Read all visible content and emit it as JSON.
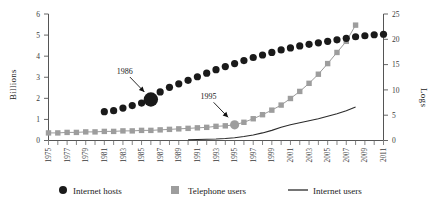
{
  "chart_data": {
    "type": "line",
    "title": "",
    "subtitle": "",
    "xlabel": "",
    "ylabel": "Billions",
    "ylabel_right": "Logs",
    "ylim": [
      0,
      6
    ],
    "ylim_right": [
      0,
      25
    ],
    "grid": false,
    "legend_position": "bottom",
    "x": [
      1975,
      1976,
      1977,
      1978,
      1979,
      1980,
      1981,
      1982,
      1983,
      1984,
      1985,
      1986,
      1987,
      1988,
      1989,
      1990,
      1991,
      1992,
      1993,
      1994,
      1995,
      1996,
      1997,
      1998,
      1999,
      2000,
      2001,
      2002,
      2003,
      2004,
      2005,
      2006,
      2007,
      2008,
      2009,
      2010,
      2011
    ],
    "xtick_labels": [
      "1975",
      "1977",
      "1979",
      "1981",
      "1983",
      "1985",
      "1987",
      "1989",
      "1991",
      "1993",
      "1995",
      "1997",
      "1999",
      "2001",
      "2003",
      "2005",
      "2007",
      "2009",
      "2011"
    ],
    "ytick_labels": [
      "0",
      "1",
      "2",
      "3",
      "4",
      "5",
      "6"
    ],
    "ytick_labels_right": [
      "0",
      "5",
      "10",
      "15",
      "20",
      "25"
    ],
    "series": [
      {
        "name": "Internet hosts",
        "marker": "circle",
        "color": "#1a1a1a",
        "axis": "right",
        "x": [
          1981,
          1982,
          1983,
          1984,
          1985,
          1986,
          1987,
          1988,
          1989,
          1990,
          1991,
          1992,
          1993,
          1994,
          1995,
          1996,
          1997,
          1998,
          1999,
          2000,
          2001,
          2002,
          2003,
          2004,
          2005,
          2006,
          2007,
          2008,
          2009,
          2010,
          2011
        ],
        "values": [
          5.7,
          5.9,
          6.4,
          6.9,
          7.4,
          8.1,
          9.6,
          10.5,
          11.2,
          11.9,
          12.6,
          13.3,
          14.0,
          14.6,
          15.2,
          15.8,
          16.4,
          16.9,
          17.4,
          17.9,
          18.3,
          18.7,
          19.0,
          19.3,
          19.6,
          19.9,
          20.2,
          20.5,
          20.7,
          20.9,
          21.0
        ]
      },
      {
        "name": "Telephone users",
        "marker": "square",
        "color": "#9d9d9d",
        "axis": "right",
        "x": [
          1975,
          1976,
          1977,
          1978,
          1979,
          1980,
          1981,
          1982,
          1983,
          1984,
          1985,
          1986,
          1987,
          1988,
          1989,
          1990,
          1991,
          1992,
          1993,
          1994,
          1995,
          1996,
          1997,
          1998,
          1999,
          2000,
          2001,
          2002,
          2003,
          2004,
          2005,
          2006,
          2007,
          2008
        ],
        "values": [
          1.5,
          1.5,
          1.6,
          1.6,
          1.7,
          1.7,
          1.8,
          1.8,
          1.9,
          1.9,
          2.0,
          2.0,
          2.1,
          2.2,
          2.3,
          2.4,
          2.5,
          2.6,
          2.8,
          2.9,
          3.1,
          3.6,
          4.3,
          5.1,
          6.0,
          7.0,
          8.3,
          9.7,
          11.3,
          13.1,
          15.2,
          17.4,
          19.6,
          22.8
        ]
      },
      {
        "name": "Internet users",
        "marker": "line",
        "color": "#2b2b2b",
        "axis": "right",
        "x": [
          1990,
          1991,
          1992,
          1993,
          1994,
          1995,
          1996,
          1997,
          1998,
          1999,
          2000,
          2001,
          2002,
          2003,
          2004,
          2005,
          2006,
          2007,
          2008
        ],
        "values": [
          0.15,
          0.2,
          0.25,
          0.3,
          0.4,
          0.55,
          0.8,
          1.1,
          1.5,
          2.0,
          2.6,
          3.1,
          3.5,
          3.9,
          4.3,
          4.8,
          5.3,
          5.9,
          6.6
        ]
      }
    ],
    "annotations": [
      {
        "label": "1986",
        "points_to_series": "Internet hosts",
        "points_to_x": 1986
      },
      {
        "label": "1995",
        "points_to_series": "Telephone users",
        "points_to_x": 1995
      }
    ]
  },
  "legend": {
    "items": [
      {
        "label": "Internet hosts",
        "marker": "circle",
        "color": "#1a1a1a"
      },
      {
        "label": "Telephone users",
        "marker": "square",
        "color": "#9d9d9d"
      },
      {
        "label": "Internet users",
        "marker": "line",
        "color": "#2b2b2b"
      }
    ]
  }
}
